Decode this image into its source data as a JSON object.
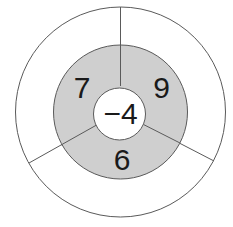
{
  "diagram": {
    "center_value": "−4",
    "segments": [
      {
        "id": "upper-left",
        "value": "7"
      },
      {
        "id": "upper-right",
        "value": "9"
      },
      {
        "id": "bottom",
        "value": "6"
      }
    ],
    "colors": {
      "ring_fill": "#cfcfcf",
      "background": "#ffffff",
      "stroke": "#5a5a5a"
    }
  }
}
